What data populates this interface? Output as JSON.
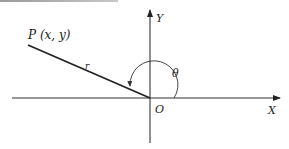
{
  "diagram": {
    "type": "polar-coordinates",
    "point_label": "P (x, y)",
    "radius_label": "r",
    "angle_label": "θ",
    "origin_label": "O",
    "x_axis_label": "X",
    "y_axis_label": "Y",
    "colors": {
      "line": "#222222",
      "axis": "#333333",
      "background": "#ffffff"
    }
  }
}
